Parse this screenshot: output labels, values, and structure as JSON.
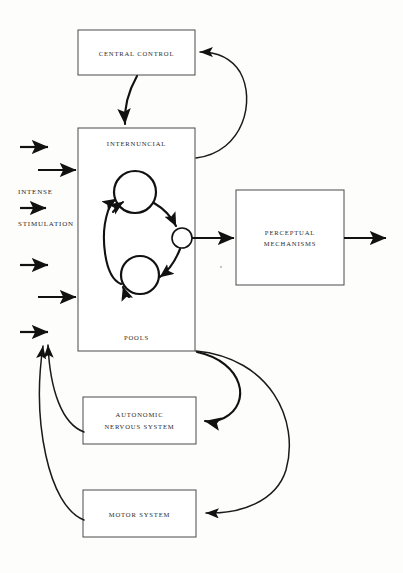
{
  "diagram": {
    "background_color": "#fdfdfc",
    "stroke_color": "#111111",
    "box_stroke_color": "#4a4a4a",
    "boxes": [
      {
        "id": "central-control",
        "label": "CENTRAL  CONTROL",
        "lines": [
          "CENTRAL  CONTROL"
        ],
        "x": 78,
        "y": 30,
        "width": 117,
        "height": 45
      },
      {
        "id": "internuncial-pools",
        "label": "INTERNUNCIAL POOLS",
        "lines": [
          "INTERNUNCIAL",
          "POOLS"
        ],
        "x": 78,
        "y": 128,
        "width": 117,
        "height": 223
      },
      {
        "id": "perceptual-mechanisms",
        "label": "PERCEPTUAL MECHANISMS",
        "lines": [
          "PERCEPTUAL",
          "MECHANISMS"
        ],
        "x": 236,
        "y": 190,
        "width": 108,
        "height": 95
      },
      {
        "id": "autonomic-nervous-system",
        "label": "AUTONOMIC NERVOUS SYSTEM",
        "lines": [
          "AUTONOMIC",
          "NERVOUS SYSTEM"
        ],
        "x": 83,
        "y": 397,
        "width": 113,
        "height": 47
      },
      {
        "id": "motor-system",
        "label": "MOTOR SYSTEM",
        "lines": [
          "MOTOR SYSTEM"
        ],
        "x": 83,
        "y": 490,
        "width": 113,
        "height": 47
      }
    ],
    "side_labels": [
      {
        "id": "intense",
        "text": "INTENSE",
        "x": 18,
        "y": 192
      },
      {
        "id": "stimulation",
        "text": "STIMULATION",
        "x": 18,
        "y": 224
      }
    ],
    "input_arrows": [
      {
        "id": "input-1",
        "x1": 20,
        "y1": 147,
        "x2": 50,
        "y2": 147
      },
      {
        "id": "input-2",
        "x1": 38,
        "y1": 170,
        "x2": 78,
        "y2": 170
      },
      {
        "id": "input-3",
        "x1": 20,
        "y1": 208,
        "x2": 50,
        "y2": 208
      },
      {
        "id": "input-4",
        "x1": 20,
        "y1": 265,
        "x2": 50,
        "y2": 265
      },
      {
        "id": "input-5",
        "x1": 38,
        "y1": 297,
        "x2": 78,
        "y2": 297
      },
      {
        "id": "input-6",
        "x1": 20,
        "y1": 332,
        "x2": 50,
        "y2": 332
      }
    ],
    "output_arrows": [
      {
        "id": "perceptual-output",
        "x1": 344,
        "y1": 238,
        "x2": 388,
        "y2": 238
      },
      {
        "id": "pool-to-perceptual",
        "x1": 192,
        "y1": 238,
        "x2": 236,
        "y2": 238
      }
    ],
    "inner_nodes": [
      {
        "id": "upper-pool-node",
        "cx": 135,
        "cy": 192,
        "r": 21
      },
      {
        "id": "lower-pool-node",
        "cx": 140,
        "cy": 275,
        "r": 19
      },
      {
        "id": "gate-node",
        "cx": 182,
        "cy": 238,
        "r": 10
      }
    ],
    "connections": [
      {
        "id": "central-control-to-pools",
        "from": "central-control",
        "to": "internuncial-pools",
        "kind": "short-curve-down"
      },
      {
        "id": "pools-to-central-control",
        "from": "internuncial-pools",
        "to": "central-control",
        "kind": "right-arc-up"
      },
      {
        "id": "pools-to-autonomic",
        "from": "internuncial-pools",
        "to": "autonomic-nervous-system",
        "kind": "right-arc-down"
      },
      {
        "id": "pools-to-motor",
        "from": "internuncial-pools",
        "to": "motor-system",
        "kind": "wide-right-arc-down"
      },
      {
        "id": "autonomic-feedback",
        "from": "autonomic-nervous-system",
        "to": "internuncial-pools",
        "kind": "left-arc-up"
      },
      {
        "id": "motor-feedback",
        "from": "motor-system",
        "to": "internuncial-pools",
        "kind": "wide-left-arc-up"
      },
      {
        "id": "upper-to-gate",
        "from": "upper-pool-node",
        "to": "gate-node",
        "kind": "loop-arc"
      },
      {
        "id": "gate-to-lower",
        "from": "gate-node",
        "to": "lower-pool-node",
        "kind": "loop-arc"
      },
      {
        "id": "lower-to-upper",
        "from": "lower-pool-node",
        "to": "upper-pool-node",
        "kind": "loop-arc"
      }
    ]
  }
}
